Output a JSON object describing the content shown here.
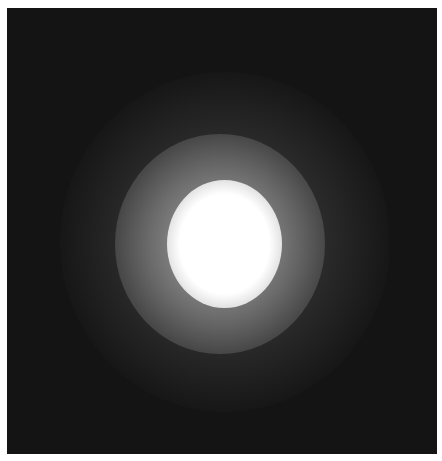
{
  "image": {
    "description": "Soft glowing white light blob centered on a dark square background",
    "background_color": "#141414",
    "frame": {
      "x": 7,
      "y": 8,
      "width": 430,
      "height": 446
    },
    "blob": {
      "center_x": 218,
      "center_y": 237,
      "core_diameter": 120,
      "mid_halo_diameter": 210,
      "outer_halo_diameter": 330,
      "core_color": "#ffffff",
      "halo_color": "#8a8a8a"
    }
  }
}
